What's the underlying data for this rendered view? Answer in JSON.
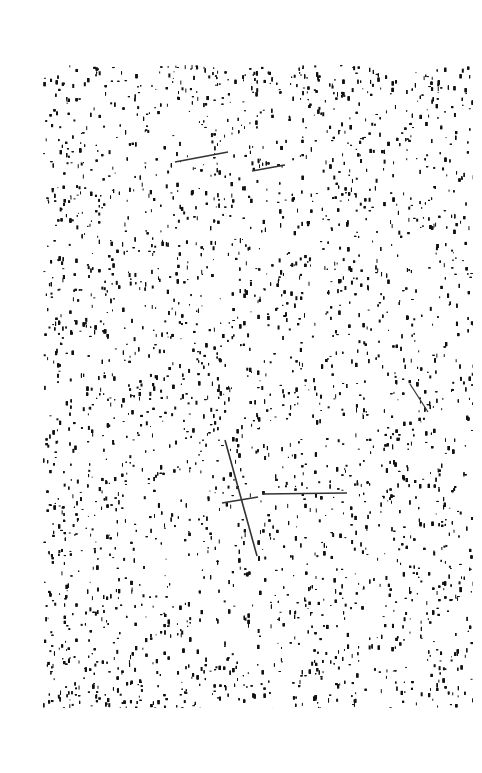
{
  "page": {
    "background": "#ffffff",
    "width": 482,
    "height": 773
  },
  "scan_field": {
    "x": 43,
    "y": 65,
    "width": 430,
    "height": 643,
    "ink_color": "#111111",
    "density": 0.2,
    "seed": 7
  },
  "marks": [
    {
      "type": "line",
      "x1": 225,
      "y1": 440,
      "x2": 257,
      "y2": 556,
      "width": 1.6,
      "color": "#333333"
    },
    {
      "type": "line",
      "x1": 222,
      "y1": 503,
      "x2": 258,
      "y2": 497,
      "width": 1.6,
      "color": "#333333"
    },
    {
      "type": "line",
      "x1": 262,
      "y1": 494,
      "x2": 347,
      "y2": 493,
      "width": 1.4,
      "color": "#333333"
    },
    {
      "type": "line",
      "x1": 175,
      "y1": 162,
      "x2": 228,
      "y2": 152,
      "width": 1.4,
      "color": "#333333"
    },
    {
      "type": "line",
      "x1": 252,
      "y1": 171,
      "x2": 285,
      "y2": 165,
      "width": 1.4,
      "color": "#333333"
    },
    {
      "type": "line",
      "x1": 410,
      "y1": 384,
      "x2": 428,
      "y2": 412,
      "width": 1.2,
      "color": "#333333"
    }
  ]
}
